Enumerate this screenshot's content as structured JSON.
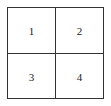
{
  "grid": {
    "rows": 2,
    "cols": 2,
    "cells": [
      {
        "label": "1"
      },
      {
        "label": "2"
      },
      {
        "label": "3"
      },
      {
        "label": "4"
      }
    ],
    "line_color": "#333333"
  }
}
